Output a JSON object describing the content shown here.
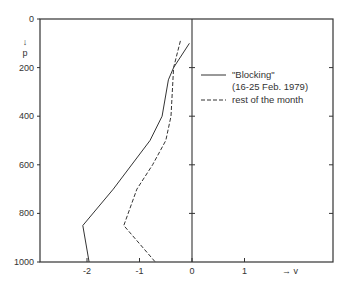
{
  "chart_data": {
    "type": "line",
    "title": "",
    "xlabel": "→ v",
    "ylabel": "p",
    "ylabel_arrow": "↓",
    "xlim": [
      -2.9,
      2.65
    ],
    "ylim": [
      1000,
      0
    ],
    "y_inverted": true,
    "grid": false,
    "x_ticks": [
      -2,
      -1,
      0,
      1
    ],
    "x_tick_labels": [
      "-2",
      "-1",
      "0",
      "1"
    ],
    "y_ticks": [
      0,
      200,
      400,
      600,
      800,
      1000
    ],
    "y_tick_labels": [
      "0",
      "200",
      "400",
      "600",
      "800",
      "1000"
    ],
    "zero_line": {
      "x": 0,
      "ticks_at_p": [
        200,
        400,
        600,
        800
      ]
    },
    "legend_position": "upper right",
    "series": [
      {
        "name": "\"Blocking\" (16-25 Feb. 1979)",
        "style": "solid",
        "points": [
          {
            "v": -0.05,
            "p": 100
          },
          {
            "v": -0.35,
            "p": 200
          },
          {
            "v": -0.45,
            "p": 250
          },
          {
            "v": -0.57,
            "p": 400
          },
          {
            "v": -0.8,
            "p": 500
          },
          {
            "v": -1.5,
            "p": 700
          },
          {
            "v": -2.08,
            "p": 850
          },
          {
            "v": -1.96,
            "p": 1000
          }
        ]
      },
      {
        "name": "rest of the month",
        "style": "dashed",
        "points": [
          {
            "v": -0.22,
            "p": 90
          },
          {
            "v": -0.35,
            "p": 200
          },
          {
            "v": -0.4,
            "p": 400
          },
          {
            "v": -0.5,
            "p": 500
          },
          {
            "v": -0.75,
            "p": 600
          },
          {
            "v": -1.05,
            "p": 700
          },
          {
            "v": -1.3,
            "p": 850
          },
          {
            "v": -0.7,
            "p": 1000
          }
        ]
      }
    ]
  },
  "legend": {
    "items": [
      {
        "label_line1": "\"Blocking\"",
        "label_line2": "(16-25 Feb. 1979)",
        "style": "solid"
      },
      {
        "label_line1": "rest of the month",
        "style": "dashed"
      }
    ]
  },
  "axes": {
    "x_axis_label": "→ v",
    "y_axis_label": "p",
    "y_axis_arrow": "↓"
  }
}
